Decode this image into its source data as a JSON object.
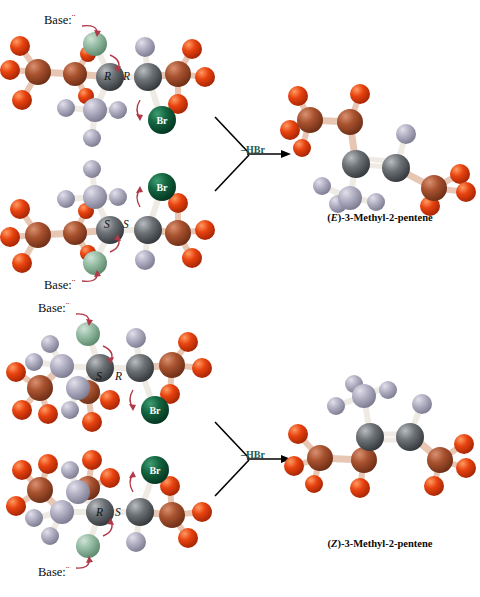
{
  "figure": {
    "title_partial": "",
    "background": "#ffffff"
  },
  "palette": {
    "carbon_gray": "#555a5e",
    "carbon_gray_light": "#8d9298",
    "hydrogen_lavender": "#a9a7bd",
    "methyl_red_carbon": "#9e4a2c",
    "methyl_red_h": "#e24410",
    "bromine_green": "#12603c",
    "leaving_h_green": "#8fb69e",
    "bond_white": "#f0ece6",
    "bond_pink": "#e8c6b4",
    "curly_arrow_red": "#b03a48",
    "reaction_arrow_black": "#000000",
    "hbr_text": "#1d5c4f"
  },
  "reactions": [
    {
      "id": "top",
      "reactants": [
        {
          "id": "RR",
          "base_label": "Base:",
          "base_lone_pair": "¨",
          "stereo_left": "R",
          "stereo_right": "R",
          "bromine_label": "Br",
          "base_position": "top"
        },
        {
          "id": "SS",
          "base_label": "Base:",
          "base_lone_pair": "¨",
          "stereo_left": "S",
          "stereo_right": "S",
          "bromine_label": "Br",
          "base_position": "bottom"
        }
      ],
      "arrow_label": "–HBr",
      "product": {
        "name_prefix": "(",
        "name_descriptor": "E",
        "name_suffix": ")-3-Methyl-2-pentene",
        "full_name": "(E)-3-Methyl-2-pentene"
      }
    },
    {
      "id": "bottom",
      "reactants": [
        {
          "id": "SR",
          "base_label": "Base:",
          "base_lone_pair": "¨",
          "stereo_left": "S",
          "stereo_right": "R",
          "bromine_label": "Br",
          "base_position": "top"
        },
        {
          "id": "RS",
          "base_label": "Base:",
          "base_lone_pair": "¨",
          "stereo_left": "R",
          "stereo_right": "S",
          "bromine_label": "Br",
          "base_position": "bottom"
        }
      ],
      "arrow_label": "–HBr",
      "product": {
        "name_prefix": "(",
        "name_descriptor": "Z",
        "name_suffix": ")-3-Methyl-2-pentene",
        "full_name": "(Z)-3-Methyl-2-pentene"
      }
    }
  ]
}
